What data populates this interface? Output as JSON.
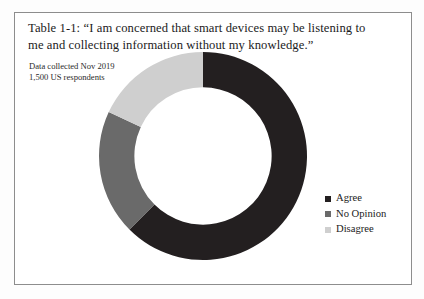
{
  "figure": {
    "title": "Table 1-1: “I am concerned that smart devices may be listening to me and collecting information without my knowledge.”",
    "annotation_line1": "Data collected Nov 2019",
    "annotation_line2": "1,500 US respondents"
  },
  "colors": {
    "agree": "#231f20",
    "no_opinion": "#6a6a6a",
    "disagree": "#cfcfcf",
    "frame_border": "#8d8d8d",
    "page_background": "#fdfdfd",
    "text": "#1b1b1b"
  },
  "legend": {
    "position": "right",
    "items": [
      {
        "label": "Agree",
        "color": "#231f20"
      },
      {
        "label": "No Opinion",
        "color": "#6a6a6a"
      },
      {
        "label": "Disagree",
        "color": "#cfcfcf"
      }
    ]
  },
  "chart_data": {
    "type": "pie",
    "variant": "donut",
    "title": "Table 1-1: “I am concerned that smart devices may be listening to me and collecting information without my knowledge.”",
    "subtitle": "Data collected Nov 2019 — 1,500 US respondents",
    "xlabel": "",
    "ylabel": "",
    "start_angle_deg": 0,
    "direction": "clockwise",
    "inner_radius_ratio": 0.66,
    "categories": [
      "Agree",
      "No Opinion",
      "Disagree"
    ],
    "values": [
      62.5,
      19.5,
      18.0
    ],
    "units": "percent",
    "colors": [
      "#231f20",
      "#6a6a6a",
      "#cfcfcf"
    ],
    "segments": [
      {
        "label": "Agree",
        "value": 62.5,
        "start_deg": 0,
        "end_deg": 225,
        "color": "#231f20"
      },
      {
        "label": "No Opinion",
        "value": 19.5,
        "start_deg": 225,
        "end_deg": 295,
        "color": "#6a6a6a"
      },
      {
        "label": "Disagree",
        "value": 18.0,
        "start_deg": 295,
        "end_deg": 360,
        "color": "#cfcfcf"
      }
    ],
    "legend_position": "right",
    "grid": false
  }
}
